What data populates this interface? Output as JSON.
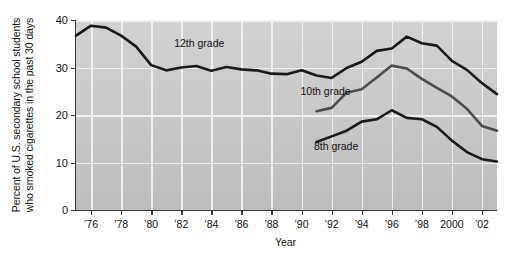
{
  "chart_data": {
    "type": "line",
    "title": "",
    "xlabel": "Year",
    "ylabel": "Percent of U.S. secondary school students who smoked cigarettes in the past 30 days",
    "ylabel_line1": "Percent of U.S. secondary school students",
    "ylabel_line2": "who smoked cigarettes in the past 30 days",
    "xlim": [
      1975,
      2003
    ],
    "ylim": [
      0,
      40
    ],
    "yticks": [
      0,
      10,
      20,
      30,
      40
    ],
    "ytick_labels": [
      "0",
      "10",
      "20",
      "30",
      "40"
    ],
    "xticks": [
      1976,
      1978,
      1980,
      1982,
      1984,
      1986,
      1988,
      1990,
      1992,
      1994,
      1996,
      1998,
      2000,
      2002
    ],
    "xtick_labels": [
      "’76",
      "’78",
      "’80",
      "’82",
      "’84",
      "’86",
      "’88",
      "’90",
      "’92",
      "’94",
      "’96",
      "’98",
      "2000",
      "’02"
    ],
    "grid": true,
    "grid_color": "#f0f0f0",
    "plot_background": "#c9c9c9",
    "legend_position": "inline-annotations",
    "series": [
      {
        "name": "12th grade",
        "color": "#1a1a1a",
        "label_x": 1983.2,
        "label_y": 35.2,
        "x": [
          1975,
          1976,
          1977,
          1978,
          1979,
          1980,
          1981,
          1982,
          1983,
          1984,
          1985,
          1986,
          1987,
          1988,
          1989,
          1990,
          1991,
          1992,
          1993,
          1994,
          1995,
          1996,
          1997,
          1998,
          1999,
          2000,
          2001,
          2002,
          2003
        ],
        "values": [
          36.7,
          38.8,
          38.4,
          36.7,
          34.4,
          30.5,
          29.4,
          30.0,
          30.3,
          29.3,
          30.1,
          29.6,
          29.4,
          28.7,
          28.6,
          29.4,
          28.3,
          27.8,
          29.9,
          31.2,
          33.5,
          34.0,
          36.5,
          35.1,
          34.6,
          31.4,
          29.5,
          26.7,
          24.4
        ]
      },
      {
        "name": "10th grade",
        "color": "#4d4d4d",
        "label_x": 1991.6,
        "label_y": 25.0,
        "x": [
          1991,
          1992,
          1993,
          1994,
          1995,
          1996,
          1997,
          1998,
          1999,
          2000,
          2001,
          2002,
          2003
        ],
        "values": [
          20.8,
          21.5,
          24.7,
          25.4,
          27.9,
          30.4,
          29.8,
          27.6,
          25.7,
          23.9,
          21.3,
          17.7,
          16.7
        ]
      },
      {
        "name": "8th grade",
        "color": "#1a1a1a",
        "label_x": 1992.3,
        "label_y": 13.4,
        "x": [
          1991,
          1992,
          1993,
          1994,
          1995,
          1996,
          1997,
          1998,
          1999,
          2000,
          2001,
          2002,
          2003
        ],
        "values": [
          14.3,
          15.5,
          16.7,
          18.6,
          19.1,
          21.0,
          19.4,
          19.1,
          17.5,
          14.6,
          12.2,
          10.7,
          10.2
        ]
      }
    ]
  }
}
